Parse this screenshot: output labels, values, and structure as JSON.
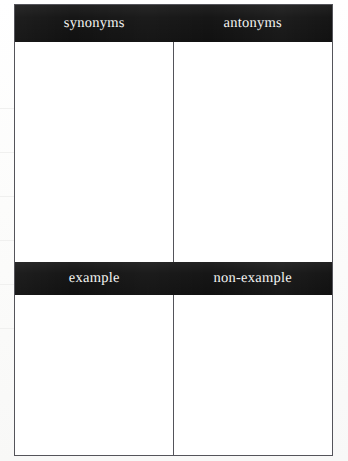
{
  "document": {
    "type": "graphic-organizer-worksheet",
    "layout": "two-by-two-grid",
    "background_color": "#fdfdfd",
    "band_color": "#161616",
    "band_text_color": "#f4f4f2",
    "border_color": "#54545a",
    "cell_fill_color": "#ffffff"
  },
  "organizer": {
    "rows": [
      {
        "row_id": "row-1",
        "headers": [
          {
            "id": "synonyms",
            "label": "synonyms"
          },
          {
            "id": "antonyms",
            "label": "antonyms"
          }
        ],
        "cells": [
          {
            "id": "synonyms-area",
            "value": ""
          },
          {
            "id": "antonyms-area",
            "value": ""
          }
        ]
      },
      {
        "row_id": "row-2",
        "headers": [
          {
            "id": "example",
            "label": "example"
          },
          {
            "id": "non-example",
            "label": "non-example"
          }
        ],
        "cells": [
          {
            "id": "example-area",
            "value": ""
          },
          {
            "id": "non-example-area",
            "value": ""
          }
        ]
      }
    ]
  }
}
